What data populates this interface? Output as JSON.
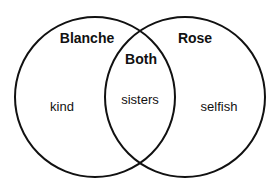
{
  "diagram": {
    "type": "venn",
    "sets": [
      {
        "name": "Blanche",
        "unique": "kind"
      },
      {
        "name": "Rose",
        "unique": "selfish"
      }
    ],
    "intersection": {
      "label": "Both",
      "content": "sisters"
    },
    "colors": {
      "stroke": "#111111",
      "background": "#ffffff"
    }
  }
}
